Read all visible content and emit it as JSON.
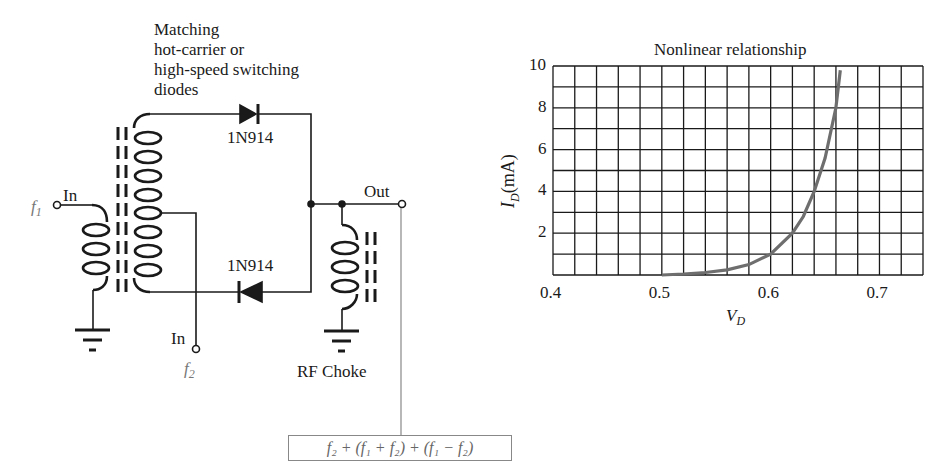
{
  "circuit": {
    "annotation": [
      "Matching",
      "hot-carrier or",
      "high-speed switching",
      "diodes"
    ],
    "diode_top_label": "1N914",
    "diode_bottom_label": "1N914",
    "input1": {
      "label": "In",
      "signal": "f",
      "subscript": "1"
    },
    "input2": {
      "label": "In",
      "signal": "f",
      "subscript": "2"
    },
    "output_label": "Out",
    "choke_label": "RF Choke",
    "output_formula": "f₂ + (f₁ + f₂) + (f₁ − f₂)"
  },
  "chart_data": {
    "type": "line",
    "title": "Nonlinear relationship",
    "xlabel": "V_D",
    "ylabel": "I_D(mA)",
    "xlim": [
      0.4,
      0.74
    ],
    "ylim": [
      0,
      10
    ],
    "x_ticks": [
      "0.4",
      "0.5",
      "0.6",
      "0.7"
    ],
    "y_ticks": [
      "2",
      "4",
      "6",
      "8",
      "10"
    ],
    "grid": true,
    "grid_x_step": 0.02,
    "grid_y_step": 1,
    "series": [
      {
        "name": "Diode I-V curve",
        "color": "#6e6e6e",
        "x": [
          0.5,
          0.52,
          0.54,
          0.56,
          0.58,
          0.6,
          0.62,
          0.63,
          0.64,
          0.65,
          0.66,
          0.664
        ],
        "y": [
          0.0,
          0.05,
          0.12,
          0.25,
          0.5,
          1.0,
          2.0,
          2.8,
          4.0,
          5.6,
          8.0,
          9.8
        ]
      }
    ]
  }
}
